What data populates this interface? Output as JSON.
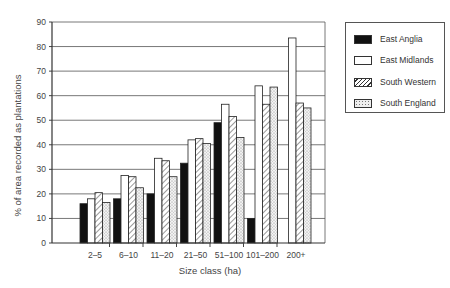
{
  "chart_data": {
    "type": "bar",
    "title": "",
    "xlabel": "Size class (ha)",
    "ylabel": "% of area recorded as plantations",
    "ylim": [
      0,
      90
    ],
    "yticks": [
      0,
      10,
      20,
      30,
      40,
      50,
      60,
      70,
      80,
      90
    ],
    "grid": true,
    "legend_position": "right",
    "categories": [
      "2–5",
      "6–10",
      "11–20",
      "21–50",
      "51–100",
      "101–200",
      "200+"
    ],
    "series": [
      {
        "name": "East Anglia",
        "fill": "solid",
        "color": "#111111",
        "values": [
          16,
          18,
          20,
          32.5,
          49,
          10,
          0
        ]
      },
      {
        "name": "East Midlands",
        "fill": "white",
        "color": "#ffffff",
        "values": [
          18,
          27.5,
          34.5,
          42,
          56.5,
          64,
          83.5
        ]
      },
      {
        "name": "South Western",
        "fill": "hatched",
        "color": "#ffffff",
        "values": [
          20.5,
          27,
          33.5,
          42.5,
          51.5,
          56.5,
          57
        ]
      },
      {
        "name": "South England",
        "fill": "stippled",
        "color": "#e6e6e6",
        "values": [
          16.5,
          22.5,
          27,
          40.5,
          43,
          63.5,
          55
        ]
      }
    ]
  }
}
